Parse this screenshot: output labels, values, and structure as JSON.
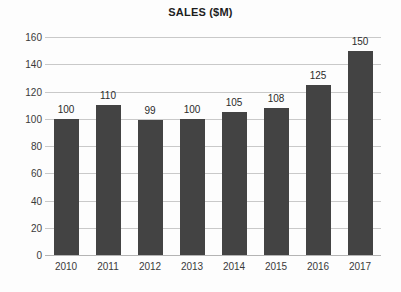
{
  "chart_data": {
    "type": "bar",
    "title": "SALES ($M)",
    "xlabel": "",
    "ylabel": "",
    "categories": [
      "2010",
      "2011",
      "2012",
      "2013",
      "2014",
      "2015",
      "2016",
      "2017"
    ],
    "values": [
      100,
      110,
      99,
      100,
      105,
      108,
      125,
      150
    ],
    "value_labels": [
      "100",
      "110",
      "99",
      "100",
      "105",
      "108",
      "125",
      "150"
    ],
    "ylim": [
      0,
      160
    ],
    "ytick_labels": [
      "0",
      "20",
      "40",
      "60",
      "80",
      "100",
      "120",
      "140",
      "160"
    ],
    "ytick_values": [
      0,
      20,
      40,
      60,
      80,
      100,
      120,
      140,
      160
    ],
    "grid": true,
    "legend": "none",
    "series_name": "Sales",
    "colors": {
      "bar": "#434343",
      "gridline": "#c9c9c9",
      "axis": "#b4b4b4",
      "text": "#2b2b2b",
      "background": "#fdfdfd"
    }
  }
}
